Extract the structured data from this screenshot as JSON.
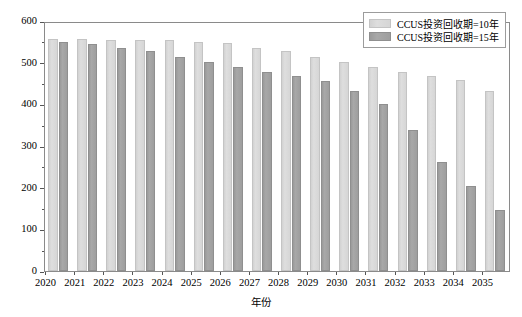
{
  "chart_data": {
    "type": "bar",
    "title": "",
    "xlabel": "年份",
    "ylabel": "燃煤电厂CCUS改造潜力(GW)",
    "categories": [
      "2020",
      "2021",
      "2022",
      "2023",
      "2024",
      "2025",
      "2026",
      "2027",
      "2028",
      "2029",
      "2030",
      "2031",
      "2032",
      "2033",
      "2034",
      "2035"
    ],
    "series": [
      {
        "name": "CCUS投资回收期=10年",
        "color": "#dcdcdc",
        "values": [
          557,
          557,
          555,
          555,
          555,
          550,
          547,
          535,
          529,
          514,
          501,
          489,
          477,
          468,
          458,
          433
        ]
      },
      {
        "name": "CCUS投资回收期=15年",
        "color": "#a3a3a3",
        "values": [
          550,
          546,
          535,
          528,
          513,
          501,
          489,
          477,
          468,
          457,
          432,
          401,
          338,
          261,
          203,
          146
        ]
      }
    ],
    "ylim": [
      0,
      600
    ],
    "ytick_labels": [
      "0",
      "100",
      "200",
      "300",
      "400",
      "500",
      "600"
    ],
    "ytick_values": [
      0,
      100,
      200,
      300,
      400,
      500,
      600
    ],
    "yminor_values": [
      50,
      150,
      250,
      350,
      450,
      550
    ],
    "grid": false,
    "legend_position": "top-right"
  }
}
